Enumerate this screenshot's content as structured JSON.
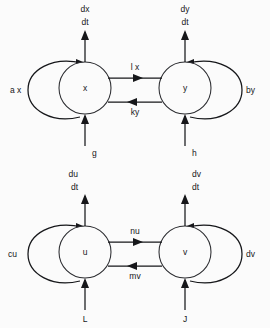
{
  "figure": {
    "background_color": "#fbfbfb",
    "line_color": "#16171a",
    "node_stroke_color": "#2a2b2f"
  },
  "diagrams": [
    {
      "id": "upper",
      "nodes": [
        {
          "id": "x",
          "label": "x",
          "cx": 85,
          "cy": 88,
          "r": 26
        },
        {
          "id": "y",
          "label": "y",
          "cx": 185,
          "cy": 88,
          "r": 26
        }
      ],
      "outputs": [
        {
          "from": "x",
          "line1": "dx",
          "line2": "dt",
          "align": "center"
        },
        {
          "from": "y",
          "line1": "dy",
          "line2": "dt",
          "align": "center"
        }
      ],
      "inputs": [
        {
          "to": "x",
          "label": "g"
        },
        {
          "to": "y",
          "label": "h"
        }
      ],
      "self_loops": [
        {
          "on": "x",
          "label": "a x",
          "side": "left"
        },
        {
          "on": "y",
          "label": "by",
          "side": "right"
        }
      ],
      "couplings": [
        {
          "from": "x",
          "to": "y",
          "label": "l x",
          "direction": "right"
        },
        {
          "from": "y",
          "to": "x",
          "label": "ky",
          "direction": "left"
        }
      ]
    },
    {
      "id": "lower",
      "nodes": [
        {
          "id": "u",
          "label": "u",
          "cx": 85,
          "cy": 252,
          "r": 26
        },
        {
          "id": "v",
          "label": "v",
          "cx": 185,
          "cy": 252,
          "r": 26
        }
      ],
      "outputs": [
        {
          "from": "u",
          "line1": "du",
          "line2": "dt",
          "align": "left"
        },
        {
          "from": "v",
          "line1": "dv",
          "line2": "dt",
          "align": "right"
        }
      ],
      "inputs": [
        {
          "to": "u",
          "label": "L"
        },
        {
          "to": "v",
          "label": "J"
        }
      ],
      "self_loops": [
        {
          "on": "u",
          "label": "cu",
          "side": "left"
        },
        {
          "on": "v",
          "label": "dv",
          "side": "right"
        }
      ],
      "couplings": [
        {
          "from": "u",
          "to": "v",
          "label": "nu",
          "direction": "right"
        },
        {
          "from": "v",
          "to": "u",
          "label": "mv",
          "direction": "left"
        }
      ]
    }
  ]
}
